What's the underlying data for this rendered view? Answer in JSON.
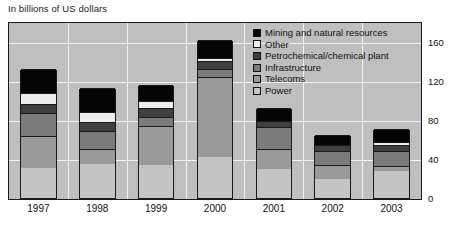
{
  "caption": "In billions of US dollars",
  "legend": {
    "position": "top-right",
    "items": [
      {
        "label": "Mining and natural resources",
        "color": "#050505",
        "key": "mining"
      },
      {
        "label": "Other",
        "color": "#ececec",
        "key": "other"
      },
      {
        "label": "Petrochemical/chemical plant",
        "color": "#3f3f3f",
        "key": "petrochemical"
      },
      {
        "label": "Infrastructure",
        "color": "#7b7b7b",
        "key": "infrastructure"
      },
      {
        "label": "Telecoms",
        "color": "#9a9a9a",
        "key": "telecoms"
      },
      {
        "label": "Power",
        "color": "#c4c4c4",
        "key": "power"
      }
    ]
  },
  "chart_data": {
    "type": "bar",
    "stacked": true,
    "title": "In billions of US dollars",
    "xlabel": "",
    "ylabel": "",
    "ylim": [
      0,
      180
    ],
    "yticks": [
      0,
      40,
      80,
      120,
      160
    ],
    "grid": true,
    "categories": [
      "1997",
      "1998",
      "1999",
      "2000",
      "2001",
      "2002",
      "2003"
    ],
    "series": [
      {
        "name": "Power",
        "color": "#c4c4c4",
        "values": [
          31,
          35,
          34,
          42,
          30,
          19,
          28
        ]
      },
      {
        "name": "Telecoms",
        "color": "#9a9a9a",
        "values": [
          32,
          15,
          40,
          82,
          20,
          15,
          5
        ]
      },
      {
        "name": "Infrastructure",
        "color": "#7b7b7b",
        "values": [
          24,
          19,
          9,
          8,
          23,
          14,
          15
        ]
      },
      {
        "name": "Petrochemical/chemical plant",
        "color": "#3f3f3f",
        "values": [
          9,
          9,
          9,
          8,
          6,
          6,
          6
        ]
      },
      {
        "name": "Other",
        "color": "#ececec",
        "values": [
          11,
          10,
          7,
          3,
          0,
          0,
          3
        ]
      },
      {
        "name": "Mining and natural resources",
        "color": "#050505",
        "values": [
          25,
          25,
          17,
          19,
          13,
          10,
          14
        ]
      }
    ],
    "totals": [
      132,
      113,
      116,
      162,
      92,
      64,
      71
    ]
  }
}
